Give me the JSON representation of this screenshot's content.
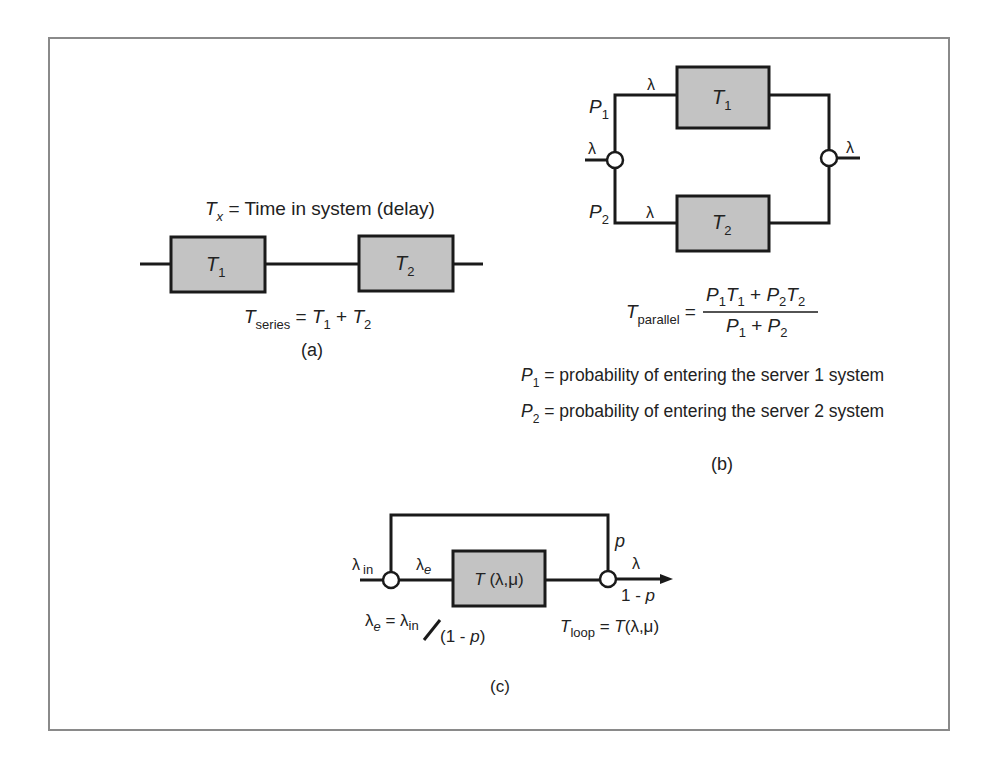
{
  "figure": {
    "frame_color": "#8a8a8a",
    "box_fill": "#c3c3c3",
    "line_color": "#1a1a1a"
  },
  "series": {
    "header_sym": "T",
    "header_sub": "x",
    "header_text": " = Time in system (delay)",
    "box1": {
      "sym": "T",
      "sub": "1"
    },
    "box2": {
      "sym": "T",
      "sub": "2"
    },
    "formula": {
      "lhs_sym": "T",
      "lhs_sub": "series",
      "eq": " = ",
      "t1": "T",
      "t1_sub": "1",
      "plus": " + ",
      "t2": "T",
      "t2_sub": "2"
    },
    "caption": "(a)"
  },
  "parallel": {
    "input_label": "λ",
    "output_label": "λ",
    "branch1": {
      "prob_sym": "P",
      "prob_sub": "1",
      "rate": "λ",
      "box_sym": "T",
      "box_sub": "1"
    },
    "branch2": {
      "prob_sym": "P",
      "prob_sub": "2",
      "rate": "λ",
      "box_sym": "T",
      "box_sub": "2"
    },
    "formula": {
      "lhs_sym": "T",
      "lhs_sub": "parallel",
      "eq": " = ",
      "num": {
        "p1": "P",
        "p1_sub": "1",
        "t1": "T",
        "t1_sub": "1",
        "plus": " + ",
        "p2": "P",
        "p2_sub": "2",
        "t2": "T",
        "t2_sub": "2"
      },
      "den": {
        "p1": "P",
        "p1_sub": "1",
        "plus": " + ",
        "p2": "P",
        "p2_sub": "2"
      }
    },
    "defs": [
      {
        "sym": "P",
        "sub": "1",
        "text": " = probability of entering the server 1 system"
      },
      {
        "sym": "P",
        "sub": "2",
        "text": " = probability of entering the server 2 system"
      }
    ],
    "caption": "(b)"
  },
  "loop": {
    "input_sym": "λ",
    "input_sub": "in",
    "internal_sym": "λ",
    "internal_sub": "e",
    "box_text_t": "T",
    "box_text_rest": " (λ,μ)",
    "feedback_label": "p",
    "output_label": "λ",
    "exit_label_num": "1 - ",
    "exit_label_p": "p",
    "eq_left": {
      "sym": "λ",
      "sub": "e",
      "eq": " = ",
      "rhs_sym": "λ",
      "rhs_sub": "in",
      "denom_open": "(1 - ",
      "denom_p": "p",
      "denom_close": ")"
    },
    "eq_right": {
      "sym": "T",
      "sub": "loop",
      "eq": " = ",
      "rhs_t": "T",
      "rhs_rest": "(λ,μ)"
    },
    "caption": "(c)"
  }
}
